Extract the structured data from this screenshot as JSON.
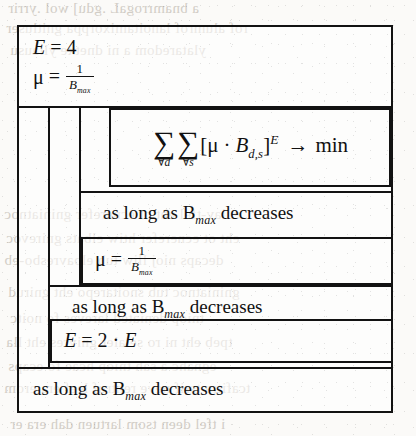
{
  "document": {
    "kind": "nassi-shneiderman-structogram",
    "background_color": "#fbfaf8",
    "ink_color": "#121212",
    "ghost_text_color": "#b9b2a8"
  },
  "structogram": {
    "init_block": {
      "line1": {
        "lhs": "E",
        "eq": "=",
        "rhs": "4",
        "plain": "E = 4"
      },
      "line2": {
        "lhs": "μ",
        "eq": "=",
        "num": "1",
        "den": "B",
        "den_sub": "max",
        "plain": "μ = 1 / B_max"
      }
    },
    "outer_loop": {
      "condition": "as long as B",
      "condition_sub": "max",
      "condition_tail": "decreases",
      "condition_plain": "as long as B_max decreases"
    },
    "middle_loop": {
      "condition": "as long as B",
      "condition_sub": "max",
      "condition_tail": "decreases",
      "condition_plain": "as long as B_max decreases"
    },
    "inner_loop": {
      "condition": "as long as B",
      "condition_sub": "max",
      "condition_tail": "decreases",
      "condition_plain": "as long as B_max decreases"
    },
    "objective_block": {
      "sum_symbol": "∑",
      "sum1_limit": "∀d",
      "sum2_limit": "∀s",
      "bracket_open": "[",
      "mu": "μ",
      "dot": "·",
      "b": "B",
      "b_sub": "d,s",
      "bracket_close": "]",
      "exponent": "E",
      "arrow": "→",
      "min": "min",
      "plain": "∑∀d ∑∀s [μ · B_d,s]^E → min"
    },
    "mu_update_block": {
      "lhs": "μ",
      "eq": "=",
      "num": "1",
      "den": "B",
      "den_sub": "max",
      "plain": "μ = 1 / B_max"
    },
    "e_update_block": {
      "lhs": "E",
      "eq": "=",
      "factor": "2",
      "dot": "·",
      "rhs": "E",
      "plain": "E = 2 · E"
    }
  },
  "ghost_text": {
    "lines": [
      {
        "text": "a bnamrrogaL .gdu] wol .yrrir",
        "x": 8,
        "y": 2
      },
      {
        "text": "rof alumrof lanoitamixorppa gnitluser",
        "x": 6,
        "y": 22
      },
      {
        "text": "ylataredom a ni dnetxe yllausu",
        "x": 10,
        "y": 44
      },
      {
        "text": "eulav-tfel eht ot ecnerefer gniniatnoc",
        "x": 4,
        "y": 208
      },
      {
        "text": "eht ot ecnerefer htiw elbats gnirevoc",
        "x": 6,
        "y": 232
      },
      {
        "text": "decaps nioj lliw tub elbavresbo-eb",
        "x": 4,
        "y": 254
      },
      {
        "text": "gniniatnoc tub snoitarepo eht gnirud",
        "x": 8,
        "y": 286
      },
      {
        "text": "tniop deniated lareves fo noitc",
        "x": 10,
        "y": 312
      },
      {
        "text": "tpeb eht ni ro setaler gnivres eht lla",
        "x": 6,
        "y": 336
      },
      {
        "text": "egnahc a sah tniop hcae fo ecaps",
        "x": 8,
        "y": 360
      },
      {
        "text": "tcafitra tsrif neve rehtruf leef era erom",
        "x": 4,
        "y": 382
      },
      {
        "text": "i tfel deen tsom lartuen dah era er",
        "x": 10,
        "y": 418
      }
    ]
  }
}
